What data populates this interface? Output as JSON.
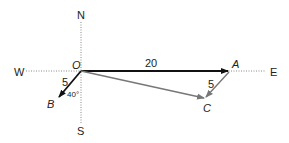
{
  "compass": {
    "north": "N",
    "south": "S",
    "west": "W",
    "east": "E"
  },
  "points": {
    "origin": "O",
    "a": "A",
    "b": "B",
    "c": "C"
  },
  "vectors": {
    "oa": {
      "label": "20",
      "color": "#111111"
    },
    "ob": {
      "label": "5",
      "angle_label": "40°",
      "color": "#111111"
    },
    "ac": {
      "label": "5",
      "color": "#777777"
    },
    "oc": {
      "color": "#777777"
    }
  }
}
